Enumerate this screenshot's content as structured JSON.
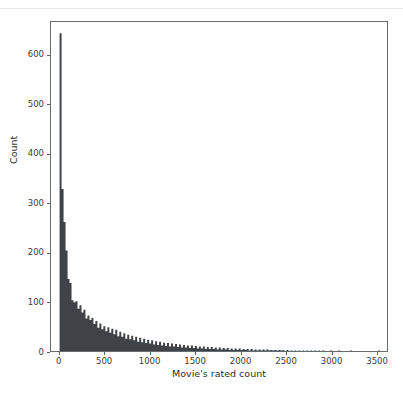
{
  "figure": {
    "background_color": "#ffffff",
    "frame_color": "#666b70",
    "bar_color": "#3f4246",
    "top_divider_color": "#e8e8e8"
  },
  "chart_data": {
    "type": "bar",
    "title": "",
    "subtitle": "",
    "xlabel": "Movie's rated count",
    "ylabel": "Count",
    "xlim": [
      -95,
      3620
    ],
    "ylim": [
      0,
      668
    ],
    "grid": false,
    "legend": null,
    "legend_position": null,
    "annotations": [],
    "xticks": [
      0,
      500,
      1000,
      1500,
      2000,
      2500,
      3000,
      3500
    ],
    "xtick_labels": [
      "0",
      "500",
      "1000",
      "1500",
      "2000",
      "2500",
      "3000",
      "3500"
    ],
    "yticks": [
      0,
      100,
      200,
      300,
      400,
      500,
      600
    ],
    "ytick_labels": [
      "0",
      "100",
      "200",
      "300",
      "400",
      "500",
      "600"
    ],
    "bin_width": 22,
    "bin_starts": [
      0,
      22,
      44,
      66,
      88,
      110,
      132,
      154,
      176,
      198,
      220,
      242,
      264,
      286,
      308,
      330,
      352,
      374,
      396,
      418,
      440,
      462,
      484,
      506,
      528,
      550,
      572,
      594,
      616,
      638,
      660,
      682,
      704,
      726,
      748,
      770,
      792,
      814,
      836,
      858,
      880,
      902,
      924,
      946,
      968,
      990,
      1012,
      1034,
      1056,
      1078,
      1100,
      1122,
      1144,
      1166,
      1188,
      1210,
      1232,
      1254,
      1276,
      1298,
      1320,
      1342,
      1364,
      1386,
      1408,
      1430,
      1452,
      1474,
      1496,
      1518,
      1540,
      1562,
      1584,
      1606,
      1628,
      1650,
      1672,
      1694,
      1716,
      1738,
      1760,
      1782,
      1804,
      1826,
      1848,
      1870,
      1892,
      1914,
      1936,
      1958,
      1980,
      2002,
      2024,
      2046,
      2068,
      2090,
      2112,
      2134,
      2156,
      2178,
      2200,
      2222,
      2244,
      2266,
      2288,
      2310,
      2332,
      2354,
      2376,
      2398,
      2420,
      2442,
      2464,
      2486,
      2508,
      2530,
      2552,
      2574,
      2596,
      2618,
      2640,
      2662,
      2684,
      2706,
      2728,
      2750,
      2772,
      2794,
      2816,
      2838,
      2860,
      2882,
      2904,
      2926,
      2948,
      2970,
      2992,
      3014,
      3036,
      3058,
      3080,
      3102,
      3124,
      3146,
      3168,
      3190,
      3212,
      3234,
      3256,
      3278,
      3300,
      3322,
      3344,
      3366,
      3388,
      3410,
      3432,
      3454,
      3476,
      3498,
      3520,
      3542
    ],
    "values": [
      645,
      329,
      262,
      204,
      146,
      138,
      103,
      99,
      101,
      86,
      93,
      78,
      84,
      66,
      72,
      63,
      67,
      55,
      61,
      47,
      56,
      44,
      50,
      40,
      48,
      37,
      45,
      34,
      43,
      30,
      39,
      29,
      36,
      25,
      33,
      24,
      31,
      22,
      29,
      19,
      27,
      18,
      25,
      16,
      23,
      15,
      22,
      13,
      20,
      12,
      19,
      11,
      17,
      10,
      16,
      9,
      15,
      9,
      14,
      8,
      13,
      7,
      12,
      7,
      11,
      6,
      11,
      6,
      10,
      5,
      9,
      5,
      9,
      4,
      8,
      4,
      8,
      4,
      7,
      3,
      7,
      3,
      6,
      3,
      6,
      2,
      5,
      2,
      5,
      2,
      5,
      2,
      4,
      2,
      4,
      1,
      4,
      1,
      3,
      1,
      3,
      1,
      3,
      1,
      3,
      1,
      2,
      1,
      2,
      1,
      2,
      1,
      2,
      0,
      2,
      0,
      1,
      0,
      1,
      0,
      1,
      0,
      1,
      0,
      1,
      0,
      1,
      0,
      1,
      0,
      1,
      0,
      1,
      0,
      0,
      0,
      1,
      0,
      0,
      0,
      1,
      0,
      0,
      0,
      0,
      0,
      1,
      0,
      0,
      0,
      0,
      0,
      0,
      0,
      0,
      0,
      0,
      0,
      0,
      0,
      1
    ]
  }
}
